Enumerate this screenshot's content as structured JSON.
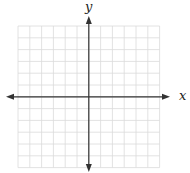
{
  "diagram": {
    "type": "coordinate-plane",
    "grid": {
      "columns": 12,
      "rows": 12,
      "left": 18,
      "top": 26,
      "cell_size": 11.8,
      "line_color": "#dadada"
    },
    "axes": {
      "color": "#333333",
      "origin": {
        "x": 88.8,
        "y": 96.8
      },
      "x_axis": {
        "label": "x",
        "from": 6,
        "to": 170
      },
      "y_axis": {
        "label": "y",
        "from": 16,
        "to": 172
      }
    }
  }
}
